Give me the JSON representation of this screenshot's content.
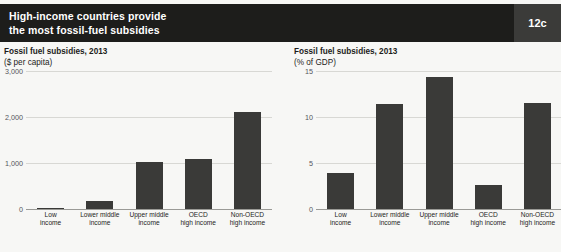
{
  "header": {
    "title_line1": "High-income countries provide",
    "title_line2": "the most fossil-fuel subsidies",
    "badge": "12c",
    "bar_color": "#1d1d1b",
    "badge_bg": "#3b3b39"
  },
  "figure": {
    "background": "#f7f7f5",
    "bar_color": "#3a3a38",
    "gridline_color": "#d8d8d4",
    "axis_color": "#9a9a96"
  },
  "chart_data": [
    {
      "type": "bar",
      "panel": "left",
      "title": "Fossil fuel subsidies, 2013",
      "subtitle": "($ per capita)",
      "xlabel": "",
      "ylabel": "",
      "ylim": [
        0,
        3000
      ],
      "yticks": [
        0,
        1000,
        2000,
        3000
      ],
      "ytick_labels": [
        "0",
        "1,000",
        "2,000",
        "3,000"
      ],
      "grid": true,
      "legend": "none",
      "categories": [
        "Low income",
        "Lower middle income",
        "Upper middle income",
        "OECD high income",
        "Non-OECD high income"
      ],
      "category_lines": [
        [
          "Low",
          "income"
        ],
        [
          "Lower middle",
          "income"
        ],
        [
          "Upper middle",
          "income"
        ],
        [
          "OECD",
          "high income"
        ],
        [
          "Non-OECD",
          "high income"
        ]
      ],
      "values": [
        20,
        180,
        1020,
        1080,
        2100
      ]
    },
    {
      "type": "bar",
      "panel": "right",
      "title": "Fossil fuel subsidies, 2013",
      "subtitle": "(% of GDP)",
      "xlabel": "",
      "ylabel": "",
      "ylim": [
        0,
        15
      ],
      "yticks": [
        0,
        5,
        10,
        15
      ],
      "ytick_labels": [
        "0",
        "5",
        "10",
        "15"
      ],
      "grid": true,
      "legend": "none",
      "categories": [
        "Low income",
        "Lower middle income",
        "Upper middle income",
        "OECD high income",
        "Non-OECD high income"
      ],
      "category_lines": [
        [
          "Low",
          "income"
        ],
        [
          "Lower middle",
          "income"
        ],
        [
          "Upper middle",
          "income"
        ],
        [
          "OECD",
          "high income"
        ],
        [
          "Non-OECD",
          "high income"
        ]
      ],
      "values": [
        3.9,
        11.4,
        14.3,
        2.6,
        11.5
      ]
    }
  ]
}
